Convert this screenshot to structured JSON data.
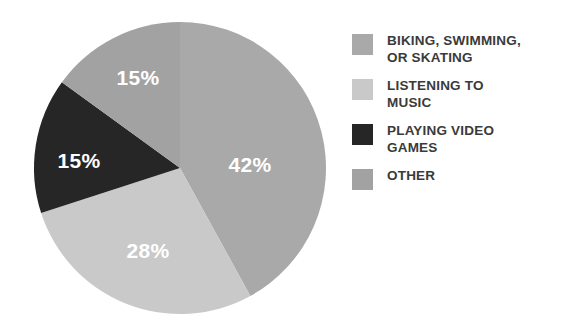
{
  "chart_data": {
    "type": "pie",
    "title": "",
    "subtitle": "",
    "xlabel": "",
    "ylabel": "",
    "grid": false,
    "legend_position": "right",
    "start_angle_deg": 0,
    "direction": "clockwise",
    "center": {
      "x": 146,
      "y": 146
    },
    "radius": 146,
    "categories": [
      "BIKING, SWIMMING,\nOR SKATING",
      "LISTENING TO\nMUSIC",
      "PLAYING VIDEO\nGAMES",
      "OTHER"
    ],
    "values": [
      42,
      28,
      15,
      15
    ],
    "value_labels": [
      "42%",
      "28%",
      "15%",
      "15%"
    ],
    "colors": [
      "#a9a9a9",
      "#c9c9c9",
      "#262626",
      "#a2a2a2"
    ],
    "label_color": "#ffffff",
    "slices": [
      {
        "label": "BIKING, SWIMMING,\nOR SKATING",
        "value": 42,
        "value_label": "42%",
        "color": "#a9a9a9",
        "label_x": 216,
        "label_y": 142
      },
      {
        "label": "LISTENING TO\nMUSIC",
        "value": 28,
        "value_label": "28%",
        "color": "#c9c9c9",
        "label_x": 114,
        "label_y": 228
      },
      {
        "label": "PLAYING VIDEO\nGAMES",
        "value": 15,
        "value_label": "15%",
        "color": "#262626",
        "label_x": 45,
        "label_y": 138
      },
      {
        "label": "OTHER",
        "value": 15,
        "value_label": "15%",
        "color": "#a2a2a2",
        "label_x": 104,
        "label_y": 55
      }
    ]
  },
  "legend": {
    "items": [
      {
        "label": "BIKING, SWIMMING,\nOR SKATING",
        "color": "#a9a9a9"
      },
      {
        "label": "LISTENING TO\nMUSIC",
        "color": "#c9c9c9"
      },
      {
        "label": "PLAYING VIDEO\nGAMES",
        "color": "#262626"
      },
      {
        "label": "OTHER",
        "color": "#a2a2a2"
      }
    ]
  }
}
